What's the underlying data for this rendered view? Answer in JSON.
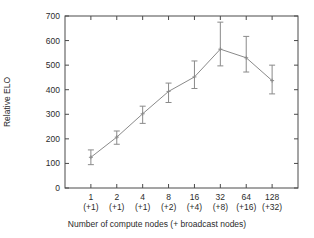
{
  "chart_data": {
    "type": "line",
    "title": "",
    "subtitle": "",
    "xlabel": "Number of compute nodes (+ broadcast nodes)",
    "ylabel": "Relative ELO",
    "categories": [
      "1\n(+1)",
      "2\n(+1)",
      "4\n(+1)",
      "8\n(+2)",
      "16\n(+4)",
      "32\n(+8)",
      "64\n(+16)",
      "128\n(+32)"
    ],
    "x_tick_top": [
      "1",
      "2",
      "4",
      "8",
      "16",
      "32",
      "64",
      "128"
    ],
    "x_tick_bottom": [
      "(+1)",
      "(+1)",
      "(+1)",
      "(+2)",
      "(+4)",
      "(+8)",
      "(+16)",
      "(+32)"
    ],
    "y_tick_labels": [
      "0",
      "100",
      "200",
      "300",
      "400",
      "500",
      "600",
      "700"
    ],
    "y_ticks": [
      0,
      100,
      200,
      300,
      400,
      500,
      600,
      700
    ],
    "ylim": [
      0,
      700
    ],
    "grid": false,
    "legend": null,
    "legend_position": "none",
    "series": [
      {
        "name": "Relative ELO",
        "values": [
          125,
          207,
          302,
          393,
          452,
          565,
          530,
          437
        ],
        "err_low": [
          95,
          178,
          263,
          348,
          405,
          497,
          472,
          383
        ],
        "err_high": [
          155,
          232,
          333,
          427,
          517,
          675,
          617,
          500
        ]
      }
    ],
    "colors": {
      "line": "#8a8a8a",
      "errorbar": "#8a8a8a",
      "axis": "#4a4a4a",
      "text": "#2b2b2b",
      "background": "#ffffff"
    }
  }
}
